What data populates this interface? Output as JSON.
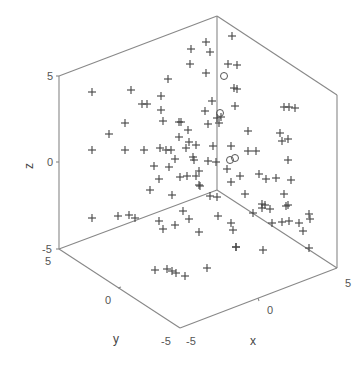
{
  "chart_data": {
    "type": "scatter",
    "subtype": "3d-scatter",
    "title": "",
    "xlabel": "x",
    "ylabel": "y",
    "zlabel": "z",
    "xlim": [
      -5,
      5
    ],
    "ylim": [
      -5,
      5
    ],
    "zlim": [
      -5,
      5
    ],
    "grid": false,
    "legend": null,
    "ticks": {
      "x": [
        "-5",
        "0",
        "5"
      ],
      "y": [
        "-5",
        "0",
        "5"
      ],
      "z": [
        "-5",
        "0",
        "5"
      ]
    },
    "series": [
      {
        "name": "plus-markers",
        "marker": "+",
        "color": "#444444",
        "screen_points": [
          [
            92,
            92
          ],
          [
            131,
            90
          ],
          [
            142,
            104
          ],
          [
            147,
            104
          ],
          [
            161,
            96
          ],
          [
            161,
            110
          ],
          [
            163,
            121
          ],
          [
            168,
            79
          ],
          [
            179,
            122
          ],
          [
            181,
            122
          ],
          [
            125,
            123
          ],
          [
            109,
            134
          ],
          [
            92,
            150
          ],
          [
            125,
            150
          ],
          [
            144,
            150
          ],
          [
            160,
            148
          ],
          [
            166,
            150
          ],
          [
            171,
            150
          ],
          [
            175,
            159
          ],
          [
            154,
            166
          ],
          [
            169,
            167
          ],
          [
            159,
            179
          ],
          [
            180,
            177
          ],
          [
            187,
            176
          ],
          [
            199,
            171
          ],
          [
            193,
            157
          ],
          [
            189,
            142
          ],
          [
            186,
            148
          ],
          [
            179,
            137
          ],
          [
            188,
            130
          ],
          [
            208,
            124
          ],
          [
            205,
            111
          ],
          [
            212,
            101
          ],
          [
            190,
            64
          ],
          [
            206,
            73
          ],
          [
            210,
            52
          ],
          [
            206,
            42
          ],
          [
            191,
            49
          ],
          [
            232,
            36
          ],
          [
            228,
            64
          ],
          [
            237,
            65
          ],
          [
            234,
            88
          ],
          [
            237,
            89
          ],
          [
            235,
            106
          ],
          [
            219,
            123
          ],
          [
            221,
            117
          ],
          [
            217,
            118
          ],
          [
            196,
            145
          ],
          [
            194,
            160
          ],
          [
            208,
            161
          ],
          [
            216,
            162
          ],
          [
            196,
            176
          ],
          [
            200,
            186
          ],
          [
            213,
            146
          ],
          [
            231,
            146
          ],
          [
            217,
            197
          ],
          [
            227,
            169
          ],
          [
            240,
            176
          ],
          [
            248,
            131
          ],
          [
            248,
            151
          ],
          [
            256,
            151
          ],
          [
            259,
            174
          ],
          [
            280,
            133
          ],
          [
            282,
            141
          ],
          [
            288,
            139
          ],
          [
            289,
            107
          ],
          [
            295,
            108
          ],
          [
            284,
            107
          ],
          [
            276,
            178
          ],
          [
            288,
            160
          ],
          [
            92,
            218
          ],
          [
            118,
            216
          ],
          [
            129,
            215
          ],
          [
            135,
            218
          ],
          [
            150,
            190
          ],
          [
            172,
            195
          ],
          [
            183,
            211
          ],
          [
            175,
            225
          ],
          [
            163,
            229
          ],
          [
            159,
            221
          ],
          [
            155,
            270
          ],
          [
            167,
            269
          ],
          [
            172,
            271
          ],
          [
            176,
            273
          ],
          [
            185,
            276
          ],
          [
            207,
            268
          ],
          [
            189,
            219
          ],
          [
            199,
            232
          ],
          [
            218,
            216
          ],
          [
            231,
            223
          ],
          [
            210,
            196
          ],
          [
            231,
            182
          ],
          [
            245,
            194
          ],
          [
            262,
            208
          ],
          [
            270,
            209
          ],
          [
            272,
            223
          ],
          [
            253,
            213
          ],
          [
            236,
            247
          ],
          [
            199,
            185
          ],
          [
            233,
            230
          ],
          [
            262,
            204
          ],
          [
            265,
            205
          ],
          [
            286,
            206
          ],
          [
            288,
            205
          ],
          [
            282,
            222
          ],
          [
            299,
            223
          ],
          [
            309,
            214
          ],
          [
            310,
            219
          ],
          [
            303,
            231
          ],
          [
            309,
            248
          ],
          [
            291,
            180
          ],
          [
            284,
            194
          ],
          [
            266,
            179
          ],
          [
            289,
            221
          ],
          [
            263,
            250
          ],
          [
            236,
            247
          ]
        ]
      },
      {
        "name": "circle-markers",
        "marker": "o",
        "color": "#555555",
        "screen_points": [
          [
            224,
            76
          ],
          [
            220,
            113
          ],
          [
            230,
            160
          ],
          [
            235,
            158
          ]
        ]
      }
    ]
  },
  "axes": {
    "z": {
      "label": "z",
      "ticks": [
        {
          "text": "5",
          "x": 49,
          "y": 80
        },
        {
          "text": "0",
          "x": 49,
          "y": 166
        },
        {
          "text": "-5",
          "x": 47,
          "y": 252
        }
      ]
    },
    "y": {
      "label": "y",
      "ticks": [
        {
          "text": "5",
          "x": 47,
          "y": 264
        },
        {
          "text": "0",
          "x": 107,
          "y": 303
        },
        {
          "text": "-5",
          "x": 167,
          "y": 344
        }
      ]
    },
    "x": {
      "label": "x",
      "ticks": [
        {
          "text": "-5",
          "x": 196,
          "y": 344
        },
        {
          "text": "0",
          "x": 270,
          "y": 313
        },
        {
          "text": "5",
          "x": 348,
          "y": 286
        }
      ]
    },
    "label_positions": {
      "z": {
        "x": 27,
        "y": 168
      },
      "y": {
        "x": 116,
        "y": 342
      },
      "x": {
        "x": 253,
        "y": 344
      }
    }
  }
}
